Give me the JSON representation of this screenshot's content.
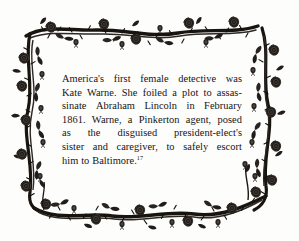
{
  "document": {
    "kind": "illustrated-fact-box",
    "background_color": "#fdfdfc",
    "ink_color": "#161412",
    "border": {
      "motif": "rose-vine-thorn-frame",
      "description": "Engraved rose branches with thorns, leaves and open roses forming a rectangular frame"
    },
    "body": {
      "lines": [
        "America's first female detective was",
        "Kate Warne. She foiled a plot to assas-",
        "sinate Abraham Lincoln in February",
        "1861. Warne, a Pinkerton agent, posed",
        "as the disguised president-elect's",
        "sister and caregiver, to safely escort",
        "him to Baltimore."
      ],
      "full_text": "America's first female detective was Kate Warne. She foiled a plot to assassinate Abraham Lincoln in February 1861. Warne, a Pinkerton agent, posed as the disguised president-elect's sister and caregiver, to safely escort him to Baltimore.",
      "footnote_marker": "17"
    }
  }
}
